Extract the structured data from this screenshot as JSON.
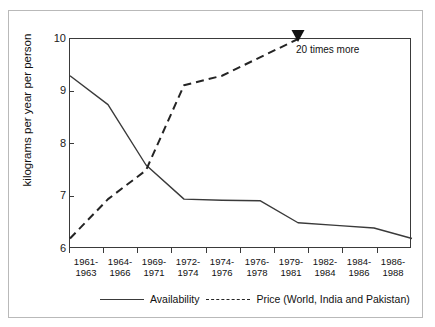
{
  "chart_data": {
    "type": "line",
    "title": "",
    "xlabel": "",
    "ylabel": "kilograms per year per person",
    "ylim": [
      6,
      10
    ],
    "yticks": [
      6,
      7,
      8,
      9,
      10
    ],
    "grid": false,
    "legend_position": "bottom",
    "categories": [
      "1961-1963",
      "1964-1966",
      "1969-1971",
      "1972-1974",
      "1974-1976",
      "1976-1978",
      "1979-1981",
      "1982-1984",
      "1984-1986",
      "1986-1988"
    ],
    "categories_lines": [
      [
        "1961-",
        "1963"
      ],
      [
        "1964-",
        "1966"
      ],
      [
        "1969-",
        "1971"
      ],
      [
        "1972-",
        "1974"
      ],
      [
        "1974-",
        "1976"
      ],
      [
        "1976-",
        "1978"
      ],
      [
        "1979-",
        "1981"
      ],
      [
        "1982-",
        "1984"
      ],
      [
        "1984-",
        "1986"
      ],
      [
        "1986-",
        "1988"
      ]
    ],
    "series": [
      {
        "name": "Availability",
        "style": "solid",
        "color": "#3a3a3a",
        "values": [
          9.3,
          8.75,
          7.6,
          6.95,
          6.93,
          6.92,
          6.5,
          6.45,
          6.4,
          6.2
        ]
      },
      {
        "name": "Price (World, India and Pakistan)",
        "style": "dashed",
        "color": "#242424",
        "values": [
          6.2,
          6.95,
          7.5,
          9.12,
          9.3,
          9.65,
          10.0,
          null,
          null,
          null
        ]
      }
    ],
    "annotations": [
      {
        "text": "20 times more",
        "marker": "down-triangle",
        "at_category": "1979-1981",
        "at_value": 10.0
      }
    ]
  },
  "legend": {
    "items": [
      {
        "label": "Availability",
        "style": "solid"
      },
      {
        "label": "Price (World, India and Pakistan)",
        "style": "dashed"
      }
    ]
  },
  "axis": {
    "y_tick_labels": [
      "10",
      "9",
      "8",
      "7",
      "6"
    ],
    "y_title": "kilograms per year per person"
  }
}
